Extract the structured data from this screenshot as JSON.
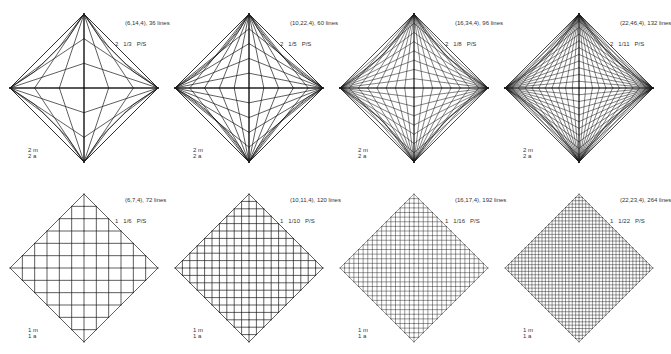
{
  "figure": {
    "rows": [
      {
        "symmetry": [
          "2 m",
          "2 a"
        ],
        "panels": [
          {
            "tuple": "(6,14,4), 36 lines",
            "order": "2",
            "fraction": "1/3",
            "type": "P/S",
            "n": 6,
            "mode": "ortho"
          },
          {
            "tuple": "(10,22,4), 60 lines",
            "order": "2",
            "fraction": "1/5",
            "type": "P/S",
            "n": 10,
            "mode": "ortho"
          },
          {
            "tuple": "(16,34,4), 96 lines",
            "order": "2",
            "fraction": "1/8",
            "type": "P/S",
            "n": 16,
            "mode": "ortho"
          },
          {
            "tuple": "(22,46,4), 132 lines",
            "order": "2",
            "fraction": "1/11",
            "type": "P/S",
            "n": 22,
            "mode": "ortho"
          }
        ]
      },
      {
        "symmetry": [
          "1 m",
          "1 a"
        ],
        "panels": [
          {
            "tuple": "(6,7,4), 72 lines",
            "order": "1",
            "fraction": "1/6",
            "type": "P/S",
            "n": 6,
            "mode": "envelope"
          },
          {
            "tuple": "(10,11,4), 120 lines",
            "order": "1",
            "fraction": "1/10",
            "type": "P/S",
            "n": 10,
            "mode": "envelope"
          },
          {
            "tuple": "(16,17,4), 192 lines",
            "order": "1",
            "fraction": "1/16",
            "type": "P/S",
            "n": 16,
            "mode": "envelope"
          },
          {
            "tuple": "(22,23,4), 264 lines",
            "order": "1",
            "fraction": "1/22",
            "type": "P/S",
            "n": 22,
            "mode": "envelope"
          }
        ]
      }
    ],
    "colors": {
      "line": "#1a1a1a",
      "text": "#333333",
      "background": "#ffffff"
    }
  }
}
